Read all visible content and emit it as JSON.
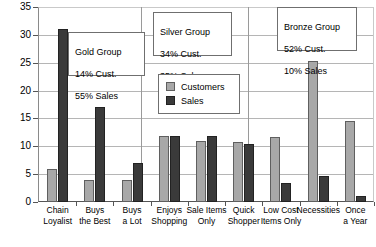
{
  "chart_data": {
    "type": "bar",
    "title": "",
    "xlabel": "",
    "ylabel": "",
    "ylim": [
      0,
      35
    ],
    "yticks": [
      0,
      5,
      10,
      15,
      20,
      25,
      30,
      35
    ],
    "grid": true,
    "legend_position": "inside-upper-center",
    "categories": [
      "Chain Loyalist",
      "Buys the Best",
      "Buys a Lot",
      "Enjoys Shopping",
      "Sale Items Only",
      "Quick Shopper",
      "Low Cost Items Only",
      "Necessities",
      "Once a Year"
    ],
    "category_lines": [
      [
        "Chain",
        "Loyalist"
      ],
      [
        "Buys",
        "the Best"
      ],
      [
        "Buys",
        "a Lot"
      ],
      [
        "Enjoys",
        "Shopping"
      ],
      [
        "Sale Items",
        "Only"
      ],
      [
        "Quick",
        "Shopper"
      ],
      [
        "Low Cost",
        "Items Only"
      ],
      [
        "Necessities",
        ""
      ],
      [
        "Once",
        "a Year"
      ]
    ],
    "series": [
      {
        "name": "Customers",
        "color": "#a8a8a8",
        "values": [
          6,
          4,
          4,
          11.8,
          11,
          10.8,
          11.7,
          25.3,
          14.5
        ]
      },
      {
        "name": "Sales",
        "color": "#3a3a3a",
        "values": [
          31,
          17,
          7,
          11.8,
          11.8,
          10.5,
          3.5,
          4.7,
          1
        ]
      }
    ],
    "groups": [
      {
        "name": "Gold Group",
        "stat_customers": "14% Cust.",
        "stat_sales": "55% Sales",
        "categories": [
          "Chain Loyalist",
          "Buys the Best",
          "Buys a Lot"
        ]
      },
      {
        "name": "Silver Group",
        "stat_customers": "34% Cust.",
        "stat_sales": "35% Sales",
        "categories": [
          "Enjoys Shopping",
          "Sale Items Only",
          "Quick Shopper"
        ]
      },
      {
        "name": "Bronze Group",
        "stat_customers": "52% Cust.",
        "stat_sales": "10% Sales",
        "categories": [
          "Low Cost Items Only",
          "Necessities",
          "Once a Year"
        ]
      }
    ]
  },
  "axis": {
    "y_tick_labels": [
      "0",
      "5",
      "10",
      "15",
      "20",
      "25",
      "30",
      "35"
    ]
  },
  "legend": {
    "items": [
      {
        "label": "Customers",
        "swatch": "customers"
      },
      {
        "label": "Sales",
        "swatch": "sales"
      }
    ]
  },
  "callouts": [
    {
      "title": "Gold Group",
      "line2": "14% Cust.",
      "line3": "55% Sales"
    },
    {
      "title": "Silver Group",
      "line2": "34% Cust.",
      "line3": "35% Sales"
    },
    {
      "title": "Bronze Group",
      "line2": "52% Cust.",
      "line3": "10% Sales"
    }
  ]
}
